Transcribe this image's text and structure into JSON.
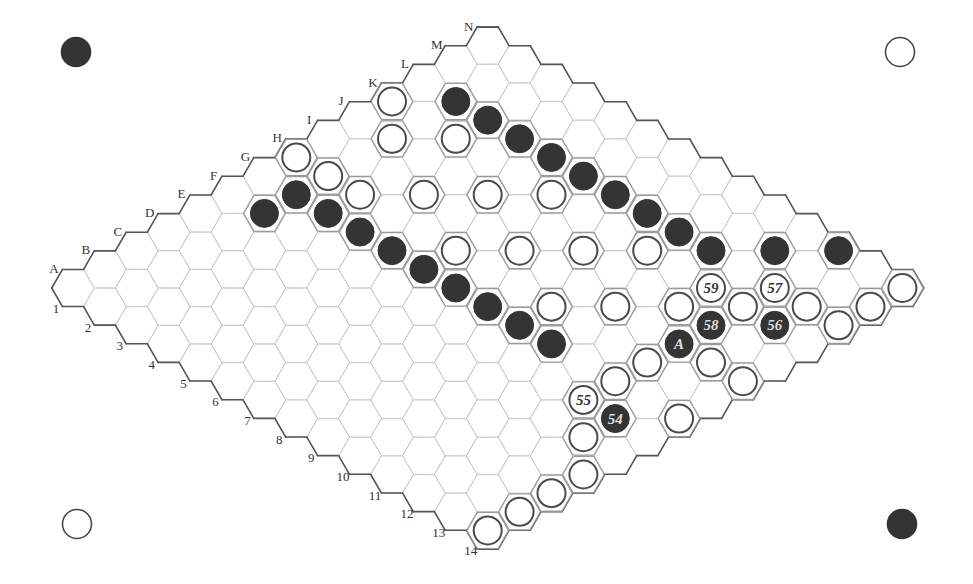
{
  "board": {
    "size": 14,
    "columns": [
      "A",
      "B",
      "C",
      "D",
      "E",
      "F",
      "G",
      "H",
      "I",
      "J",
      "K",
      "L",
      "M",
      "N"
    ],
    "rows": [
      "1",
      "2",
      "3",
      "4",
      "5",
      "6",
      "7",
      "8",
      "9",
      "10",
      "11",
      "12",
      "13",
      "14"
    ],
    "origin": [
      73,
      288
    ],
    "step": [
      31.9,
      18.65
    ],
    "hex_radius": 21.3,
    "stone_radius": 14
  },
  "colors": {
    "grid": "#bdbdbd",
    "border": "#555555",
    "occupied_outline": "#9a9a9a",
    "black_stone": "#343434",
    "white_stone": "#ffffff",
    "white_stroke": "#4a4a4a",
    "label": "#333333"
  },
  "corner_stones": [
    {
      "position": "top-left",
      "color": "black",
      "x": 76,
      "y": 52
    },
    {
      "position": "top-right",
      "color": "white",
      "x": 900,
      "y": 52
    },
    {
      "position": "bottom-left",
      "color": "white",
      "x": 77,
      "y": 524
    },
    {
      "position": "bottom-right",
      "color": "black",
      "x": 902,
      "y": 524
    }
  ],
  "stones": {
    "black": [
      {
        "cell": "L2"
      },
      {
        "cell": "L3"
      },
      {
        "cell": "L4"
      },
      {
        "cell": "L5"
      },
      {
        "cell": "L6"
      },
      {
        "cell": "L7"
      },
      {
        "cell": "L8"
      },
      {
        "cell": "L9"
      },
      {
        "cell": "L10"
      },
      {
        "cell": "M11"
      },
      {
        "cell": "N12"
      },
      {
        "cell": "F2"
      },
      {
        "cell": "G2"
      },
      {
        "cell": "G3"
      },
      {
        "cell": "G4"
      },
      {
        "cell": "G5"
      },
      {
        "cell": "G6"
      },
      {
        "cell": "G7"
      },
      {
        "cell": "G8"
      },
      {
        "cell": "G9"
      },
      {
        "cell": "G10"
      },
      {
        "cell": "I12",
        "label": "A"
      },
      {
        "cell": "J12",
        "label": "58"
      },
      {
        "cell": "K13",
        "label": "56"
      },
      {
        "cell": "F13",
        "label": "54"
      }
    ],
    "white": [
      {
        "cell": "K1"
      },
      {
        "cell": "J2"
      },
      {
        "cell": "K3"
      },
      {
        "cell": "H1"
      },
      {
        "cell": "H2"
      },
      {
        "cell": "H3"
      },
      {
        "cell": "I4"
      },
      {
        "cell": "J5"
      },
      {
        "cell": "K6"
      },
      {
        "cell": "H6"
      },
      {
        "cell": "I7"
      },
      {
        "cell": "J8"
      },
      {
        "cell": "K9"
      },
      {
        "cell": "H9"
      },
      {
        "cell": "I10"
      },
      {
        "cell": "J11"
      },
      {
        "cell": "K12"
      },
      {
        "cell": "L13"
      },
      {
        "cell": "M14"
      },
      {
        "cell": "N14"
      },
      {
        "cell": "L14"
      },
      {
        "cell": "K11",
        "label": "59"
      },
      {
        "cell": "L12",
        "label": "57"
      },
      {
        "cell": "F12",
        "label": "55"
      },
      {
        "cell": "H12"
      },
      {
        "cell": "I13"
      },
      {
        "cell": "I14"
      },
      {
        "cell": "G12"
      },
      {
        "cell": "G14"
      },
      {
        "cell": "E13"
      },
      {
        "cell": "D14"
      },
      {
        "cell": "C14"
      },
      {
        "cell": "B14"
      },
      {
        "cell": "A14"
      }
    ]
  }
}
